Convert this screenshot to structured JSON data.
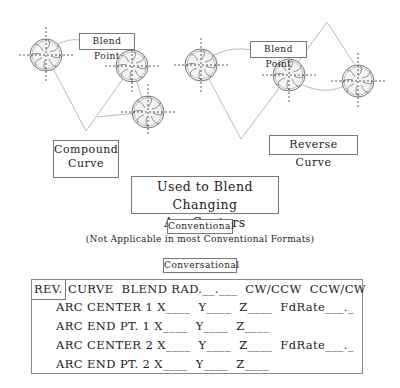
{
  "diagram": {
    "labels": {
      "blend_point_left": "Blend Point",
      "blend_point_right": "Blend Point",
      "compound_curve": [
        "Compound",
        "Curve"
      ],
      "reverse_curve": "Reverse Curve",
      "used_to_blend": [
        "Used to Blend Changing",
        "Arc Centers"
      ]
    },
    "colors": {
      "line": "#aaaaaa",
      "cutter": "#666666",
      "dash": "#444444"
    }
  },
  "conventional": {
    "label": "Conventional",
    "note": "(Not Applicable in most Conventional Formats)"
  },
  "conversational": {
    "label": "Conversational",
    "header": {
      "rev": "REV.",
      "text": "CURVE  BLEND RAD.__.___  CW/CCW  CCW/CW"
    },
    "rows": [
      "ARC CENTER 1 X____  Y____  Z____  FdRate___._",
      "ARC END PT. 1 X____  Y____  Z____",
      "ARC CENTER 2 X____  Y____  Z____  FdRate___._",
      "ARC END PT. 2 X____  Y____  Z____"
    ]
  }
}
